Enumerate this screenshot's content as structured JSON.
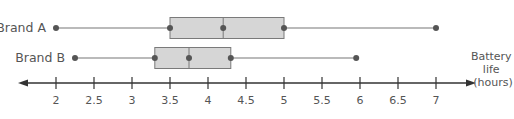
{
  "chart_data": {
    "type": "boxplot",
    "title": "",
    "xlabel": "Battery life (hours)",
    "xlabel_lines": [
      "Battery",
      "life",
      "(hours)"
    ],
    "ylabel": "",
    "xlim": [
      1.5,
      7.5
    ],
    "ticks": [
      2,
      2.5,
      3,
      3.5,
      4,
      4.5,
      5,
      5.5,
      6,
      6.5,
      7
    ],
    "tick_labels": [
      "2",
      "2.5",
      "3",
      "3.5",
      "4",
      "4.5",
      "5",
      "5.5",
      "6",
      "6.5",
      "7"
    ],
    "grid": false,
    "legend": null,
    "series": [
      {
        "name": "Brand A",
        "min": 2,
        "q1": 3.5,
        "median": 4.2,
        "q3": 5,
        "max": 7
      },
      {
        "name": "Brand B",
        "min": 2.25,
        "q1": 3.3,
        "median": 3.75,
        "q3": 4.3,
        "max": 5.95
      }
    ]
  },
  "colors": {
    "box_fill": "#d6d6d6",
    "box_stroke": "#7a7a7a",
    "whisker": "#777777",
    "dot": "#555555",
    "axis": "#333333",
    "text": "#555555"
  }
}
